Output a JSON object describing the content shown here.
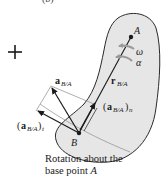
{
  "figure": {
    "panel_label": "(b)",
    "sign_symbol": "+",
    "points": {
      "A": "A",
      "B": "B"
    },
    "labels": {
      "omega": "ω",
      "alpha": "α",
      "r_main": "r",
      "r_sub": "B/A",
      "a_main": "a",
      "a_sub": "B/A",
      "an_open": "(",
      "an_main": "a",
      "an_sub": "B/A",
      "an_close": ")",
      "an_outer_sub": "n",
      "at_open": "(",
      "at_main": "a",
      "at_sub": "B/A",
      "at_close": ")",
      "at_outer_sub": "t"
    },
    "caption": {
      "line1": "Rotation about the",
      "line2_prefix": "base point ",
      "line2_point": "A"
    },
    "colors": {
      "body_fill": "#e6e6e6",
      "body_stroke": "#2a2a2a",
      "vector": "#1a1a1a",
      "rotation_arrows": "#9a9a9a",
      "guide_lines": "#8c8c8c"
    }
  }
}
